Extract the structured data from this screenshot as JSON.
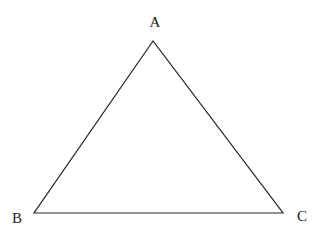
{
  "diagram": {
    "type": "triangle",
    "stroke_color": "#222222",
    "background": "#ffffff",
    "vertices": [
      {
        "label": "A",
        "x": 153,
        "y": 41,
        "label_x": 155,
        "label_y": 27
      },
      {
        "label": "B",
        "x": 34,
        "y": 213,
        "label_x": 17,
        "label_y": 223
      },
      {
        "label": "C",
        "x": 283,
        "y": 213,
        "label_x": 302,
        "label_y": 221
      }
    ]
  }
}
